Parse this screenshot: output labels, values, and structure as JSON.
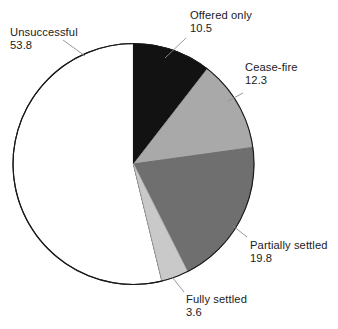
{
  "chart_data": {
    "type": "pie",
    "title": "",
    "subtitle": "",
    "xlabel": "",
    "ylabel": "",
    "legend_position": "none",
    "grid": false,
    "units": "percent",
    "start_angle_deg": 0,
    "direction": "clockwise",
    "total": 100.0,
    "categories": [
      "Offered only",
      "Cease-fire",
      "Partially settled",
      "Fully settled",
      "Unsuccessful"
    ],
    "values": [
      10.5,
      12.3,
      19.8,
      3.6,
      53.8
    ],
    "colors": [
      "#121212",
      "#a9a9a9",
      "#6f6f6f",
      "#c9c9c9",
      "#ffffff"
    ],
    "slices": [
      {
        "label": "Offered only",
        "value": 10.5,
        "value_text": "10.5",
        "color": "#121212"
      },
      {
        "label": "Cease-fire",
        "value": 12.3,
        "value_text": "12.3",
        "color": "#a9a9a9"
      },
      {
        "label": "Partially settled",
        "value": 19.8,
        "value_text": "19.8",
        "color": "#6f6f6f"
      },
      {
        "label": "Fully settled",
        "value": 3.6,
        "value_text": "3.6",
        "color": "#c9c9c9"
      },
      {
        "label": "Unsuccessful",
        "value": 53.8,
        "value_text": "53.8",
        "color": "#ffffff"
      }
    ]
  },
  "labels": {
    "offered_only": {
      "name": "Offered only",
      "value": "10.5"
    },
    "cease_fire": {
      "name": "Cease-fire",
      "value": "12.3"
    },
    "partially_settled": {
      "name": "Partially settled",
      "value": "19.8"
    },
    "fully_settled": {
      "name": "Fully settled",
      "value": "3.6"
    },
    "unsuccessful": {
      "name": "Unsuccessful",
      "value": "53.8"
    }
  },
  "style": {
    "outline_color": "#1a1a1a",
    "leader_color": "#8a8a8a",
    "background": "#ffffff"
  }
}
